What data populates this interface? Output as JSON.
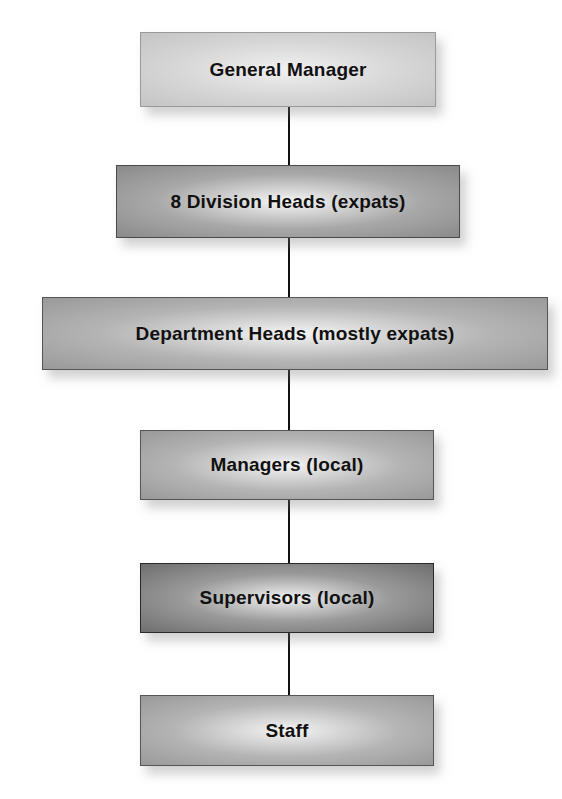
{
  "chart": {
    "type": "org-chart",
    "nodes": [
      {
        "id": "gm",
        "label": "General Manager"
      },
      {
        "id": "division",
        "label": "8 Division Heads (expats)"
      },
      {
        "id": "department",
        "label": "Department Heads (mostly expats)"
      },
      {
        "id": "managers",
        "label": "Managers (local)"
      },
      {
        "id": "supervisors",
        "label": "Supervisors (local)"
      },
      {
        "id": "staff",
        "label": "Staff"
      }
    ],
    "edges": [
      [
        "gm",
        "division"
      ],
      [
        "division",
        "department"
      ],
      [
        "department",
        "managers"
      ],
      [
        "managers",
        "supervisors"
      ],
      [
        "supervisors",
        "staff"
      ]
    ]
  }
}
